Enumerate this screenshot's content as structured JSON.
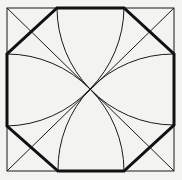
{
  "figure": {
    "colors": {
      "background": "#f3f3f1",
      "line": "#1a1a1a",
      "thick_line": "#111111"
    },
    "square": {
      "x1": 7,
      "y1": 8,
      "x2": 174,
      "y2": 171
    },
    "center": {
      "x": 90,
      "y": 89
    },
    "octagon_vertices": [
      [
        57,
        8
      ],
      [
        124,
        8
      ],
      [
        174,
        54
      ],
      [
        174,
        125
      ],
      [
        124,
        171
      ],
      [
        58,
        171
      ],
      [
        7,
        126
      ],
      [
        7,
        54
      ]
    ],
    "arc_radius": 117
  }
}
